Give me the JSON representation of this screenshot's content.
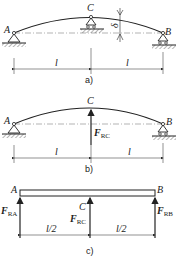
{
  "figure": {
    "panels": [
      {
        "id": "a",
        "caption": "a)",
        "points": {
          "left": "A",
          "middle": "C",
          "right": "B"
        },
        "deflection_label": "δ",
        "spans": [
          "l",
          "l"
        ]
      },
      {
        "id": "b",
        "caption": "b)",
        "points": {
          "left": "A",
          "middle": "C",
          "right": "B"
        },
        "force_label": "F",
        "force_sub": "RC",
        "spans": [
          "l",
          "l"
        ]
      },
      {
        "id": "c",
        "caption": "c)",
        "points": {
          "left": "A",
          "middle": "C",
          "right": "B"
        },
        "forces": [
          {
            "label": "F",
            "sub": "RA"
          },
          {
            "label": "F",
            "sub": "RC"
          },
          {
            "label": "F",
            "sub": "RB"
          }
        ],
        "spans": [
          "l/2",
          "l/2"
        ]
      }
    ],
    "colors": {
      "ink": "#222222",
      "background": "#ffffff"
    }
  }
}
